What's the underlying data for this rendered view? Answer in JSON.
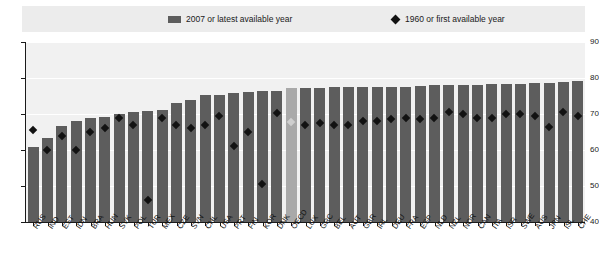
{
  "legend": {
    "bar_label": "2007 or latest available year",
    "diamond_label": "1960 or first available year"
  },
  "chart_data": {
    "type": "bar",
    "title": "",
    "xlabel": "",
    "ylabel": "",
    "ylim": [
      40,
      90
    ],
    "yticks": [
      40,
      50,
      60,
      70,
      80,
      90
    ],
    "grid": true,
    "legend_position": "top",
    "highlight_category": "OECD",
    "categories": [
      "RUS",
      "IND",
      "EST",
      "IDN",
      "BRA",
      "HUN",
      "SVK",
      "POL",
      "TUR",
      "MEX",
      "CZE",
      "SVN",
      "CHL",
      "USA",
      "PRT",
      "FIN",
      "KOR",
      "DNK",
      "OECD",
      "LUX",
      "GRC",
      "BEL",
      "AUT",
      "GBR",
      "IRL",
      "DEU",
      "FRA",
      "ESP",
      "NLD",
      "NZL",
      "NOR",
      "CAN",
      "ITA",
      "ISR",
      "SWE",
      "AUS",
      "JPN",
      "ISL",
      "CHE"
    ],
    "series": [
      {
        "name": "2007 or latest available year",
        "type": "bar",
        "values": [
          60.8,
          63.2,
          66.6,
          68.1,
          69.0,
          69.2,
          70.0,
          70.5,
          70.8,
          71.2,
          73.0,
          74.0,
          75.2,
          75.4,
          75.9,
          76.1,
          76.4,
          76.5,
          77.2,
          77.2,
          77.3,
          77.4,
          77.5,
          77.5,
          77.6,
          77.6,
          77.6,
          77.8,
          78.0,
          78.0,
          78.0,
          78.1,
          78.2,
          78.2,
          78.4,
          78.5,
          78.6,
          78.9,
          79.2
        ]
      },
      {
        "name": "1960 or first available year",
        "type": "scatter-diamond",
        "values": [
          65.5,
          60.0,
          64.0,
          60.0,
          65.0,
          66.0,
          69.0,
          67.0,
          46.0,
          69.0,
          67.0,
          66.0,
          67.0,
          69.5,
          61.0,
          65.0,
          50.5,
          70.2,
          67.8,
          67.0,
          67.5,
          67.0,
          67.0,
          68.0,
          68.0,
          68.5,
          69.0,
          68.5,
          69.0,
          70.5,
          70.0,
          69.0,
          69.0,
          70.0,
          70.0,
          69.5,
          66.5,
          70.5,
          69.5
        ]
      }
    ]
  }
}
